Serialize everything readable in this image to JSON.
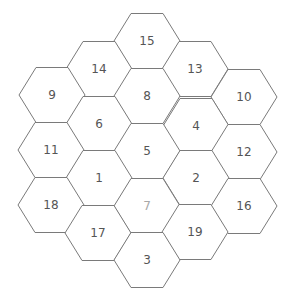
{
  "board": {
    "colors": {
      "background": "#ffffff",
      "line": "#7a7a7a",
      "label": "#555555",
      "label_faded": "#a8a8a8"
    },
    "hex_geometry": {
      "half_width": 33,
      "top_half": 16,
      "half_height": 27.5
    },
    "hexes": [
      {
        "label": "15",
        "cx": 147,
        "cy": 41,
        "faded": false
      },
      {
        "label": "14",
        "cx": 99,
        "cy": 69,
        "faded": false
      },
      {
        "label": "13",
        "cx": 195,
        "cy": 69,
        "faded": false
      },
      {
        "label": "9",
        "cx": 52,
        "cy": 95,
        "faded": false
      },
      {
        "label": "8",
        "cx": 147,
        "cy": 96,
        "faded": false
      },
      {
        "label": "10",
        "cx": 244,
        "cy": 97,
        "faded": false
      },
      {
        "label": "6",
        "cx": 99,
        "cy": 124,
        "faded": false
      },
      {
        "label": "4",
        "cx": 196,
        "cy": 126,
        "faded": false
      },
      {
        "label": "11",
        "cx": 51,
        "cy": 150,
        "faded": false
      },
      {
        "label": "5",
        "cx": 147,
        "cy": 151,
        "faded": false
      },
      {
        "label": "12",
        "cx": 244,
        "cy": 152,
        "faded": false
      },
      {
        "label": "1",
        "cx": 99,
        "cy": 178,
        "faded": false
      },
      {
        "label": "2",
        "cx": 196,
        "cy": 178,
        "faded": false
      },
      {
        "label": "18",
        "cx": 51,
        "cy": 205,
        "faded": false
      },
      {
        "label": "7",
        "cx": 147,
        "cy": 206,
        "faded": true
      },
      {
        "label": "16",
        "cx": 244,
        "cy": 206,
        "faded": false
      },
      {
        "label": "17",
        "cx": 98,
        "cy": 233,
        "faded": false
      },
      {
        "label": "19",
        "cx": 195,
        "cy": 232,
        "faded": false
      },
      {
        "label": "3",
        "cx": 147,
        "cy": 260,
        "faded": false
      }
    ]
  }
}
